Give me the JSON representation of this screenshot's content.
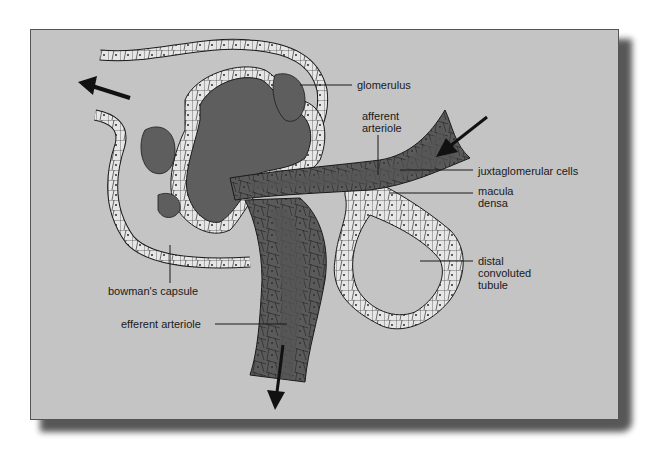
{
  "figure": {
    "colors": {
      "panel_background": "#c4c4c4",
      "vessel_dark": "#5e5e5e",
      "vessel_darker": "#4a4a4a",
      "cell_light": "#e6e6e6",
      "line": "#1a1a1a"
    },
    "labels": [
      {
        "id": "glomerulus",
        "text": "glomerulus"
      },
      {
        "id": "afferent",
        "text": "afferent\narteriole"
      },
      {
        "id": "jg_cells",
        "text": "juxtaglomerular cells"
      },
      {
        "id": "macula",
        "text": "macula\ndensa"
      },
      {
        "id": "distal",
        "text": "distal\nconvoluted\ntubule"
      },
      {
        "id": "bowman",
        "text": "bowman's capsule"
      },
      {
        "id": "efferent",
        "text": "efferent arteriole"
      }
    ],
    "arrows": [
      {
        "name": "outflow-arrow-left",
        "direction": "left"
      },
      {
        "name": "inflow-arrow-afferent",
        "direction": "down-left"
      },
      {
        "name": "outflow-arrow-efferent",
        "direction": "down"
      }
    ]
  }
}
